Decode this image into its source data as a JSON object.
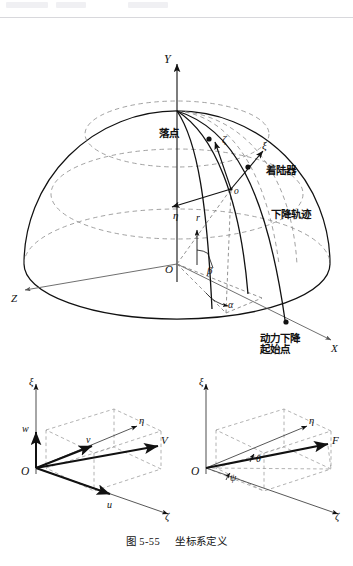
{
  "document": {
    "figure_caption_prefix": "图 5-55",
    "figure_caption_title": "坐标系定义"
  },
  "main_diagram": {
    "name": "landing-coordinate-sphere",
    "axes": [
      {
        "id": "Y",
        "label": "Y",
        "desc": "vertical axis up"
      },
      {
        "id": "X",
        "label": "X",
        "desc": "axis to lower right"
      },
      {
        "id": "Z",
        "label": "Z",
        "desc": "axis to lower left"
      }
    ],
    "origin_label": "O",
    "local_origin_label": "o",
    "angles": [
      {
        "id": "beta",
        "label": "β"
      },
      {
        "id": "alpha",
        "label": "α"
      }
    ],
    "radius_label": "r",
    "local_axes": [
      {
        "id": "xi",
        "label": "ξ"
      },
      {
        "id": "eta",
        "label": "η"
      },
      {
        "id": "zeta",
        "label": "ζ"
      }
    ],
    "annotations": [
      {
        "id": "landing-point",
        "label": "落点"
      },
      {
        "id": "lander",
        "label": "着陆器"
      },
      {
        "id": "descent-trajectory",
        "label": "下降轨迹"
      },
      {
        "id": "powered-descent-start",
        "line1": "动力下降",
        "line2": "起始点"
      }
    ]
  },
  "sub_diagram_left": {
    "name": "velocity-components",
    "origin_label": "O",
    "axes": [
      {
        "id": "xi",
        "label": "ξ"
      },
      {
        "id": "eta",
        "label": "η"
      },
      {
        "id": "zeta",
        "label": "ζ"
      }
    ],
    "vectors": [
      {
        "id": "w",
        "label": "w"
      },
      {
        "id": "v",
        "label": "v"
      },
      {
        "id": "u",
        "label": "u"
      },
      {
        "id": "V",
        "label": "V"
      }
    ]
  },
  "sub_diagram_right": {
    "name": "force-orientation",
    "origin_label": "O",
    "axes": [
      {
        "id": "xi",
        "label": "ξ"
      },
      {
        "id": "eta",
        "label": "η"
      },
      {
        "id": "zeta",
        "label": "ζ"
      }
    ],
    "vectors": [
      {
        "id": "F",
        "label": "F"
      }
    ],
    "angles": [
      {
        "id": "theta",
        "label": "θ"
      },
      {
        "id": "psi",
        "label": "ψ"
      }
    ]
  },
  "colors": {
    "ink": "#111111",
    "dashed": "#8a8a8a",
    "rule": "#d8d8dc",
    "page": "#ffffff"
  }
}
